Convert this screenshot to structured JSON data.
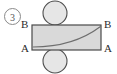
{
  "figure": {
    "index_label": "3",
    "caption": "",
    "colors": {
      "sheet_fill": "#d9d9d9",
      "roller_fill": "#e3e3e3",
      "outline": "#4a4a4a",
      "curve": "#6e6e6e",
      "text": "#2b2b2b",
      "background": "#ffffff"
    }
  },
  "labels": {
    "top_left": "B",
    "top_right": "B",
    "bottom_left": "A",
    "bottom_right": "A"
  },
  "shapes": {
    "sheet": {
      "name": "rectangular-sheet",
      "x": 32,
      "y": 25,
      "width": 69,
      "height": 25
    },
    "top_roller": {
      "name": "top-roller",
      "cx": 55,
      "cy": 13,
      "r": 12
    },
    "bottom_roller": {
      "name": "bottom-roller",
      "cx": 55,
      "cy": 61,
      "r": 12
    },
    "deformation_curve": {
      "name": "deformation-curve",
      "start": [
        33,
        47
      ],
      "end": [
        100,
        27
      ],
      "description": "curve rising from lower-left to upper-right inside the sheet"
    }
  }
}
